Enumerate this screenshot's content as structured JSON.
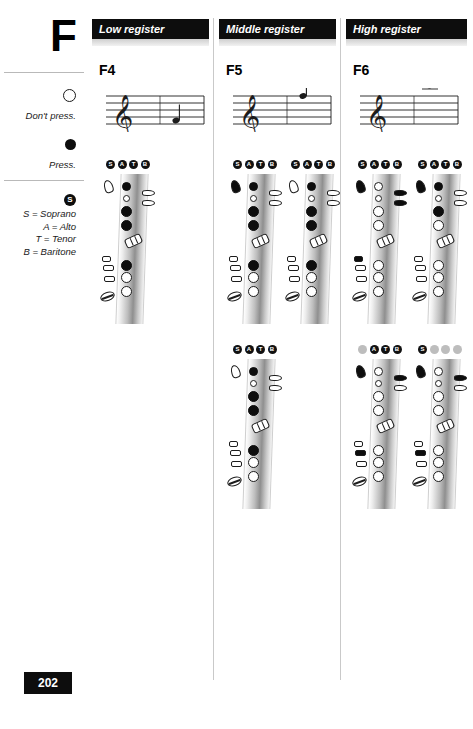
{
  "page": {
    "letter": "F",
    "page_number": "202"
  },
  "legend": {
    "open_caption": "Don't press.",
    "closed_caption": "Press.",
    "badge_letter": "S",
    "key_items": [
      {
        "icon": "open-circle-icon",
        "caption": "Don't press."
      },
      {
        "icon": "filled-circle-icon",
        "caption": "Press."
      }
    ],
    "satb": [
      "S = Soprano",
      "A = Alto",
      "T = Tenor",
      "B = Baritone"
    ]
  },
  "columns": [
    {
      "id": "low",
      "header": "Low register",
      "note": "F4",
      "staff": {
        "clef": "treble-clef-icon",
        "note_position": "space-1",
        "ledger": false
      },
      "diagrams": [
        {
          "badges": [
            {
              "label": "S",
              "active": true
            },
            {
              "label": "A",
              "active": true
            },
            {
              "label": "T",
              "active": true
            },
            {
              "label": "B",
              "active": true
            }
          ],
          "octave": "open",
          "left_hand": [
            "closed",
            "open",
            "closed",
            "closed"
          ],
          "side_keys": [
            "open",
            "open"
          ],
          "palm_keys": [
            "open",
            "open",
            "open"
          ],
          "right_hand": [
            "closed",
            "open",
            "open"
          ],
          "pinky": "open"
        }
      ]
    },
    {
      "id": "middle",
      "header": "Middle register",
      "note": "F5",
      "staff": {
        "clef": "treble-clef-icon",
        "note_position": "line-5",
        "ledger": false
      },
      "diagrams": [
        {
          "badges": [
            {
              "label": "S",
              "active": true
            },
            {
              "label": "A",
              "active": true
            },
            {
              "label": "T",
              "active": true
            },
            {
              "label": "B",
              "active": true
            }
          ],
          "octave": "closed",
          "left_hand": [
            "closed",
            "open",
            "closed",
            "closed"
          ],
          "side_keys": [
            "open",
            "open"
          ],
          "palm_keys": [
            "open",
            "open",
            "open"
          ],
          "right_hand": [
            "closed",
            "open",
            "open"
          ],
          "pinky": "open"
        },
        {
          "badges": [
            {
              "label": "S",
              "active": true
            },
            {
              "label": "A",
              "active": true
            },
            {
              "label": "T",
              "active": true
            },
            {
              "label": "B",
              "active": true
            }
          ],
          "octave": "open",
          "left_hand": [
            "closed",
            "open",
            "closed",
            "closed"
          ],
          "side_keys": [
            "open",
            "open"
          ],
          "palm_keys": [
            "open",
            "open",
            "open"
          ],
          "right_hand": [
            "closed",
            "open",
            "open"
          ],
          "pinky": "open"
        },
        {
          "badges": [
            {
              "label": "S",
              "active": true
            },
            {
              "label": "A",
              "active": true
            },
            {
              "label": "T",
              "active": true
            },
            {
              "label": "B",
              "active": true
            }
          ],
          "octave": "open",
          "left_hand": [
            "closed",
            "open",
            "closed",
            "closed"
          ],
          "side_keys": [
            "open",
            "open"
          ],
          "palm_keys": [
            "open",
            "open",
            "open"
          ],
          "right_hand": [
            "closed",
            "open",
            "open"
          ],
          "pinky": "open"
        }
      ]
    },
    {
      "id": "high",
      "header": "High register",
      "note": "F6",
      "staff": {
        "clef": "treble-clef-icon",
        "note_position": "above-staff",
        "ledger": true
      },
      "diagrams": [
        {
          "badges": [
            {
              "label": "S",
              "active": true
            },
            {
              "label": "A",
              "active": true
            },
            {
              "label": "T",
              "active": true
            },
            {
              "label": "B",
              "active": true
            }
          ],
          "octave": "closed",
          "left_hand": [
            "open",
            "open",
            "open",
            "open"
          ],
          "side_keys": [
            "closed",
            "closed"
          ],
          "palm_keys": [
            "closed",
            "open",
            "open"
          ],
          "right_hand": [
            "open",
            "open",
            "open"
          ],
          "pinky": "open"
        },
        {
          "badges": [
            {
              "label": "S",
              "active": true
            },
            {
              "label": "A",
              "active": true
            },
            {
              "label": "T",
              "active": true
            },
            {
              "label": "B",
              "active": true
            }
          ],
          "octave": "closed",
          "left_hand": [
            "closed",
            "open",
            "closed",
            "open"
          ],
          "side_keys": [
            "open",
            "open"
          ],
          "palm_keys": [
            "open",
            "open",
            "open"
          ],
          "right_hand": [
            "open",
            "open",
            "open"
          ],
          "pinky": "open"
        },
        {
          "badges": [
            {
              "label": "S",
              "active": false
            },
            {
              "label": "A",
              "active": true
            },
            {
              "label": "T",
              "active": true
            },
            {
              "label": "B",
              "active": true
            }
          ],
          "octave": "closed",
          "left_hand": [
            "open",
            "open",
            "open",
            "open"
          ],
          "side_keys": [
            "closed",
            "open"
          ],
          "palm_keys": [
            "open",
            "closed",
            "open"
          ],
          "right_hand": [
            "open",
            "open",
            "open"
          ],
          "pinky": "open"
        },
        {
          "badges": [
            {
              "label": "S",
              "active": true
            },
            {
              "label": "A",
              "active": false
            },
            {
              "label": "T",
              "active": false
            },
            {
              "label": "B",
              "active": false
            }
          ],
          "octave": "closed",
          "left_hand": [
            "open",
            "open",
            "open",
            "open"
          ],
          "side_keys": [
            "closed",
            "open"
          ],
          "palm_keys": [
            "open",
            "closed",
            "open"
          ],
          "right_hand": [
            "open",
            "open",
            "open"
          ],
          "pinky": "open"
        }
      ]
    }
  ],
  "colors": {
    "ink": "#0d0d0d",
    "header_bg": "#0d0d0d",
    "header_text": "#ffffff",
    "inactive_badge": "#bdbdbd",
    "rule": "#c9c9c9"
  }
}
